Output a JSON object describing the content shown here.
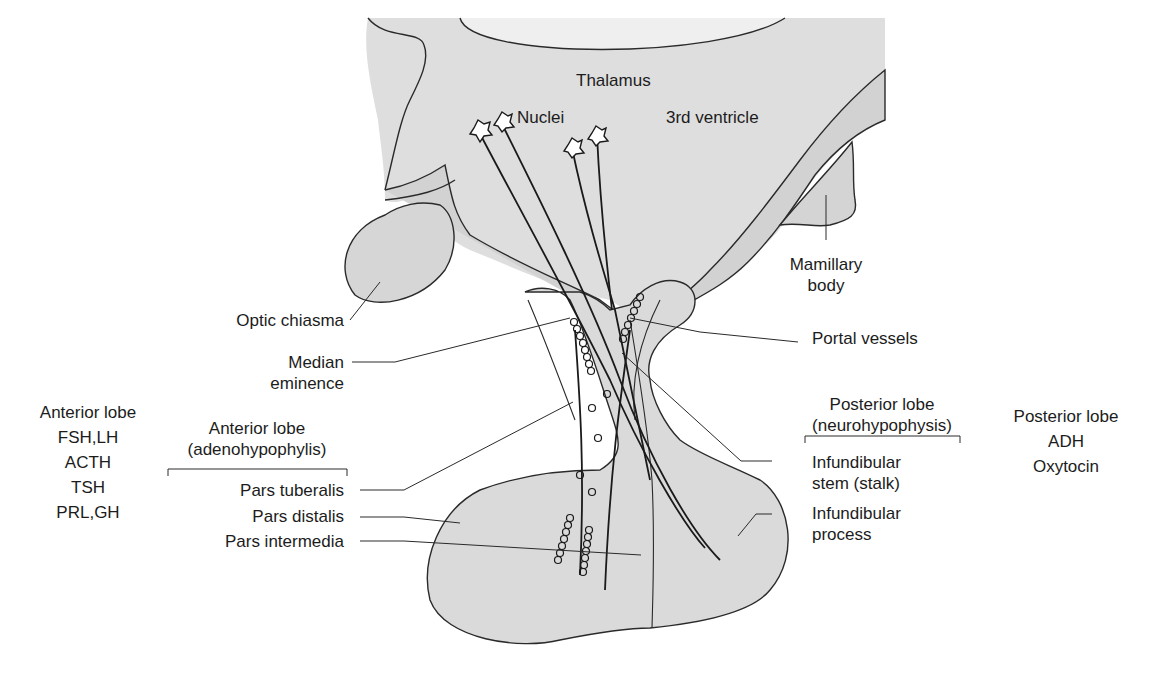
{
  "diagram": {
    "colors": {
      "tissue_fill": "#dcdcdc",
      "tissue_fill_dark": "#cfcfcf",
      "outline": "#2a2a2a",
      "text": "#1c1c1c",
      "background": "#ffffff"
    },
    "top_labels": {
      "thalamus": "Thalamus",
      "nuclei": "Nuclei",
      "third_ventricle": "3rd ventricle"
    },
    "left_labels": {
      "optic_chiasma": "Optic chiasma",
      "median_eminence": [
        "Median",
        "eminence"
      ],
      "anterior_group_header": [
        "Anterior lobe",
        "(adenohypophylis)"
      ],
      "pars_tuberalis": "Pars tuberalis",
      "pars_distalis": "Pars distalis",
      "pars_intermedia": "Pars intermedia"
    },
    "anterior_hormones": {
      "title": "Anterior lobe",
      "items": [
        "FSH,LH",
        "ACTH",
        "TSH",
        "PRL,GH"
      ]
    },
    "right_labels": {
      "mamillary_body": [
        "Mamillary",
        "body"
      ],
      "portal_vessels": "Portal vessels",
      "posterior_group_header": [
        "Posterior lobe",
        "(neurohypophysis)"
      ],
      "infundibular_stem": [
        "Infundibular",
        "stem (stalk)"
      ],
      "infundibular_process": [
        "Infundibular",
        "process"
      ]
    },
    "posterior_hormones": {
      "title": "Posterior lobe",
      "items": [
        "ADH",
        "Oxytocin"
      ]
    }
  }
}
